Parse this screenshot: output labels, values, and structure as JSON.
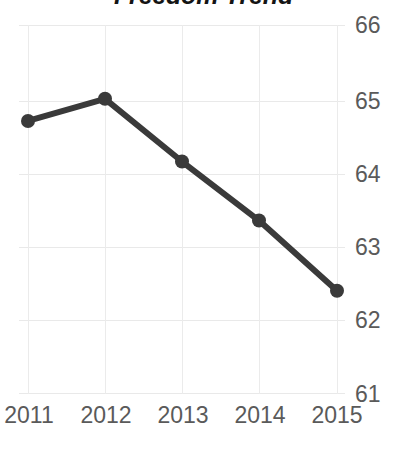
{
  "chart_data": {
    "type": "line",
    "title": "Freedom Trend",
    "xlabel": "",
    "ylabel": "",
    "categories": [
      "2011",
      "2012",
      "2013",
      "2014",
      "2015"
    ],
    "x": [
      2011,
      2012,
      2013,
      2014,
      2015
    ],
    "values": [
      64.7,
      65.0,
      64.15,
      63.35,
      62.4
    ],
    "series": [
      {
        "name": "Freedom score",
        "values": [
          64.7,
          65.0,
          64.15,
          63.35,
          62.4
        ]
      }
    ],
    "ylim": [
      61,
      66
    ],
    "yticks": [
      66,
      65,
      64,
      63,
      62,
      61
    ],
    "ytick_labels": [
      "66",
      "65",
      "64",
      "63",
      "62",
      "61"
    ],
    "xtick_labels": [
      "2011",
      "2012",
      "2013",
      "2014",
      "2015"
    ],
    "grid": true,
    "grid_axis": "both",
    "legend": false,
    "legend_position": "none",
    "markers": true,
    "annotations": []
  },
  "style": {
    "line_color": "#3a3a3a",
    "marker_color": "#3a3a3a",
    "grid_color": "#e9e9e9",
    "tick_label_color": "#5a5a5a",
    "title_color": "#141414",
    "background": "#ffffff"
  }
}
